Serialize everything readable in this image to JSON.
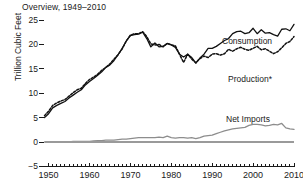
{
  "chart_data": {
    "type": "line",
    "title": "Overview, 1949–2010",
    "xlabel": "",
    "ylabel": "Trillion Cubic Feet",
    "xlim": [
      1949,
      2010
    ],
    "ylim": [
      -5,
      30
    ],
    "ytick_values": [
      30,
      25,
      20,
      15,
      10,
      5,
      0,
      -5
    ],
    "ytick_labels": [
      "30",
      "25",
      "20",
      "15",
      "10",
      "5",
      "0",
      "−5"
    ],
    "xtick_values": [
      1950,
      1960,
      1970,
      1980,
      1990,
      2000,
      2010
    ],
    "xtick_labels": [
      "1950",
      "1960",
      "1970",
      "1980",
      "1990",
      "2000",
      "2010"
    ],
    "minor_xticks": "annual",
    "grid": false,
    "legend_position": "inline-annotations",
    "x": [
      1949,
      1950,
      1951,
      1952,
      1953,
      1954,
      1955,
      1956,
      1957,
      1958,
      1959,
      1960,
      1961,
      1962,
      1963,
      1964,
      1965,
      1966,
      1967,
      1968,
      1969,
      1970,
      1971,
      1972,
      1973,
      1974,
      1975,
      1976,
      1977,
      1978,
      1979,
      1980,
      1981,
      1982,
      1983,
      1984,
      1985,
      1986,
      1987,
      1988,
      1989,
      1990,
      1991,
      1992,
      1993,
      1994,
      1995,
      1996,
      1997,
      1998,
      1999,
      2000,
      2001,
      2002,
      2003,
      2004,
      2005,
      2006,
      2007,
      2008,
      2009,
      2010
    ],
    "series": [
      {
        "name": "Consumption",
        "style": "solid",
        "color": "#111111",
        "label_text": "Consumption",
        "values": [
          5.0,
          5.8,
          7.0,
          7.5,
          7.9,
          8.3,
          9.0,
          9.6,
          10.2,
          10.7,
          11.7,
          12.4,
          13.0,
          13.7,
          14.4,
          15.3,
          15.8,
          16.7,
          17.9,
          19.2,
          20.7,
          21.8,
          22.0,
          22.1,
          22.5,
          21.2,
          19.5,
          20.3,
          19.5,
          19.6,
          20.2,
          19.9,
          19.4,
          18.0,
          17.4,
          18.0,
          17.3,
          16.2,
          17.2,
          18.0,
          19.2,
          19.2,
          19.6,
          20.2,
          20.8,
          21.2,
          22.2,
          22.6,
          22.7,
          22.2,
          22.4,
          23.3,
          22.2,
          23.0,
          22.3,
          22.4,
          22.0,
          21.7,
          23.1,
          23.2,
          22.8,
          24.1
        ]
      },
      {
        "name": "Production*",
        "style": "dashed",
        "color": "#111111",
        "label_text": "Production*",
        "values": [
          5.4,
          6.3,
          7.5,
          8.0,
          8.4,
          8.7,
          9.4,
          10.1,
          10.7,
          11.0,
          12.0,
          12.8,
          13.3,
          13.9,
          14.7,
          15.3,
          16.0,
          17.0,
          17.9,
          19.1,
          20.7,
          21.9,
          22.2,
          22.2,
          22.6,
          21.6,
          20.1,
          19.9,
          20.0,
          19.5,
          20.2,
          19.9,
          19.7,
          18.0,
          16.3,
          18.0,
          17.0,
          16.2,
          17.1,
          17.6,
          17.3,
          18.0,
          18.1,
          17.8,
          18.1,
          19.0,
          18.6,
          19.1,
          19.4,
          19.0,
          18.8,
          19.2,
          19.6,
          18.9,
          19.1,
          18.6,
          18.1,
          18.5,
          19.3,
          20.2,
          20.6,
          21.6
        ]
      },
      {
        "name": "Net Imports",
        "style": "solid",
        "color": "#8d8d8d",
        "label_text": "Net Imports",
        "values": [
          0.0,
          0.0,
          0.0,
          0.0,
          0.0,
          0.0,
          0.0,
          0.1,
          0.1,
          0.1,
          0.1,
          0.1,
          0.2,
          0.3,
          0.3,
          0.4,
          0.4,
          0.4,
          0.5,
          0.6,
          0.6,
          0.7,
          0.8,
          0.9,
          0.9,
          0.9,
          0.9,
          0.9,
          1.0,
          0.9,
          1.2,
          0.9,
          0.8,
          0.9,
          0.9,
          0.8,
          0.9,
          0.7,
          0.9,
          1.2,
          1.3,
          1.4,
          1.7,
          2.0,
          2.3,
          2.5,
          2.7,
          2.8,
          2.9,
          3.0,
          3.4,
          3.6,
          3.6,
          3.5,
          3.3,
          3.4,
          3.6,
          3.5,
          3.8,
          2.9,
          2.7,
          2.6
        ]
      }
    ],
    "annotations": [
      {
        "name": "consumption-label",
        "text": "Consumption",
        "x_px": 222,
        "y_px": 36
      },
      {
        "name": "production-label",
        "text": "Production*",
        "x_px": 228,
        "y_px": 74
      },
      {
        "name": "net-imports-label",
        "text": "Net Imports",
        "x_px": 226,
        "y_px": 114
      }
    ]
  }
}
